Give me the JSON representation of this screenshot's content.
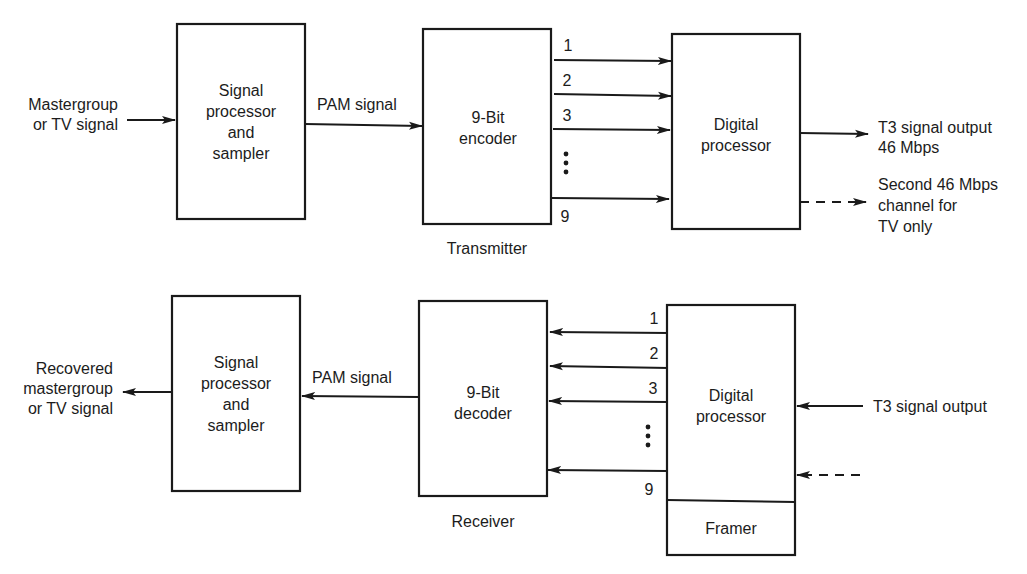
{
  "transmitter": {
    "section_label": "Transmitter",
    "input_label": [
      "Mastergroup",
      "or TV signal"
    ],
    "sampler_block": [
      "Signal",
      "processor",
      "and",
      "sampler"
    ],
    "pam_label": "PAM signal",
    "encoder_block": [
      "9-Bit",
      "encoder"
    ],
    "bit_lines": [
      "1",
      "2",
      "3",
      "9"
    ],
    "digital_processor_block": [
      "Digital",
      "processor"
    ],
    "output_label": [
      "T3 signal output",
      "46 Mbps"
    ],
    "second_output_label": [
      "Second 46 Mbps",
      "channel for",
      "TV only"
    ]
  },
  "receiver": {
    "section_label": "Receiver",
    "output_label": [
      "Recovered",
      "mastergroup",
      "or TV signal"
    ],
    "sampler_block": [
      "Signal",
      "processor",
      "and",
      "sampler"
    ],
    "pam_label": "PAM signal",
    "decoder_block": [
      "9-Bit",
      "decoder"
    ],
    "bit_lines": [
      "1",
      "2",
      "3",
      "9"
    ],
    "digital_processor_block": [
      "Digital",
      "processor"
    ],
    "framer_block": "Framer",
    "input_label": "T3 signal output"
  }
}
